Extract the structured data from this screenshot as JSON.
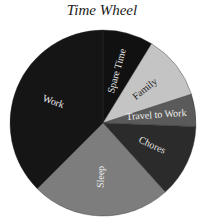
{
  "chart_data": {
    "type": "pie",
    "title": "Time Wheel",
    "start_angle_deg": 0,
    "direction": "clockwise",
    "categories": [
      "Spare Time",
      "Family",
      "Travel to Work",
      "Chores",
      "Sleep",
      "Work"
    ],
    "values": [
      2.1,
      2.7,
      1.35,
      3.05,
      5.8,
      9.0
    ],
    "unit": "hours",
    "colors": [
      "#111111",
      "#c4c4c4",
      "#5a5a5a",
      "#2b2b2b",
      "#7d7d7d",
      "#151515"
    ],
    "label_colors": [
      "#e8e8e8",
      "#1a1a1a",
      "#f0f0f0",
      "#e0e0e0",
      "#eeeeee",
      "#eeeeee"
    ],
    "legend": "none (labels inside slices)"
  }
}
